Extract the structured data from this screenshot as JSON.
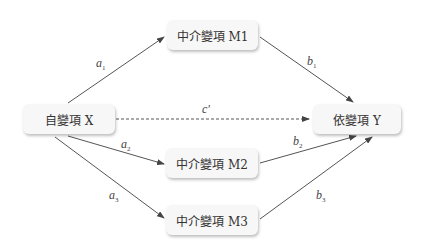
{
  "nodes": {
    "x": {
      "label": "自變項 X"
    },
    "m1": {
      "label": "中介變項 M1"
    },
    "m2": {
      "label": "中介變項 M2"
    },
    "m3": {
      "label": "中介變項 M3"
    },
    "y": {
      "label": "依變項 Y"
    }
  },
  "edges": {
    "a1": {
      "base": "a",
      "sub": "1"
    },
    "a2": {
      "base": "a",
      "sub": "2"
    },
    "a3": {
      "base": "a",
      "sub": "3"
    },
    "b1": {
      "base": "b",
      "sub": "1"
    },
    "b2": {
      "base": "b",
      "sub": "2"
    },
    "b3": {
      "base": "b",
      "sub": "3"
    },
    "c": {
      "base": "c'"
    }
  },
  "colors": {
    "arrow": "#444444",
    "node_bg": "#f7f7f7",
    "text": "#333333"
  }
}
